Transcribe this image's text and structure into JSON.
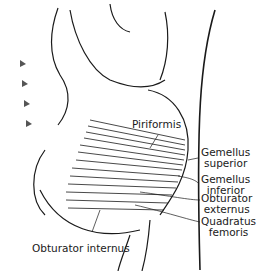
{
  "diagram": {
    "labels": [
      {
        "id": "piriformis",
        "lines": [
          "Piriformis"
        ]
      },
      {
        "id": "gemellus-superior",
        "lines": [
          "Gemellus",
          "superior"
        ]
      },
      {
        "id": "gemellus-inferior",
        "lines": [
          "Gemellus",
          "inferior"
        ]
      },
      {
        "id": "obturator-externus",
        "lines": [
          "Obturator",
          "externus"
        ]
      },
      {
        "id": "quadratus-femoris",
        "lines": [
          "Quadratus",
          "femoris"
        ]
      },
      {
        "id": "obturator-internus",
        "lines": [
          "Obturator internus"
        ]
      }
    ],
    "colors": {
      "ink": "#1a1a1a",
      "background": "#ffffff",
      "shade": "#888888"
    }
  }
}
